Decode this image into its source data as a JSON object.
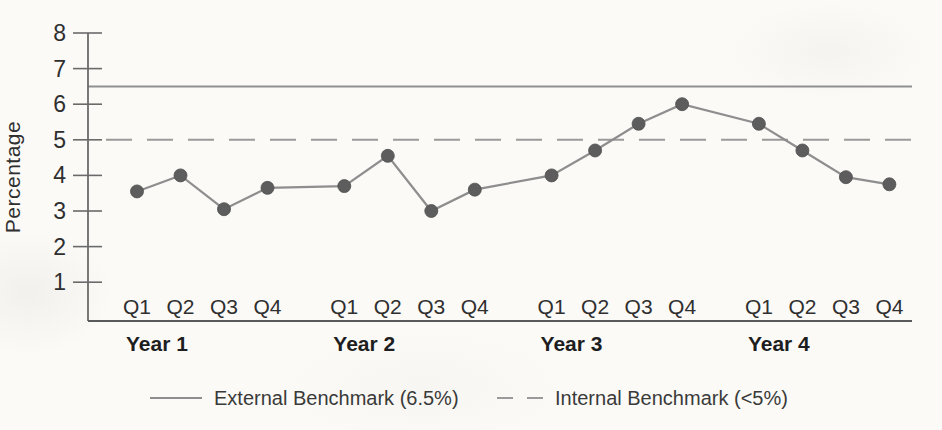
{
  "chart_data": {
    "type": "line",
    "title": "",
    "ylabel": "Percentage",
    "ylim": [
      0,
      8
    ],
    "yticks": [
      1,
      2,
      3,
      4,
      5,
      6,
      7,
      8
    ],
    "grid": false,
    "legend_position": "bottom",
    "groups": [
      {
        "label": "Year 1",
        "categories": [
          "Q1",
          "Q2",
          "Q3",
          "Q4"
        ]
      },
      {
        "label": "Year 2",
        "categories": [
          "Q1",
          "Q2",
          "Q3",
          "Q4"
        ]
      },
      {
        "label": "Year 3",
        "categories": [
          "Q1",
          "Q2",
          "Q3",
          "Q4"
        ]
      },
      {
        "label": "Year 4",
        "categories": [
          "Q1",
          "Q2",
          "Q3",
          "Q4"
        ]
      }
    ],
    "series": [
      {
        "values": [
          3.55,
          4.0,
          3.05,
          3.65,
          3.7,
          4.55,
          3.0,
          3.6,
          4.0,
          4.7,
          5.45,
          6.0,
          5.45,
          4.7,
          3.95,
          3.75
        ]
      }
    ],
    "benchmarks": [
      {
        "name": "External Benchmark (6.5%)",
        "value": 6.5,
        "style": "solid"
      },
      {
        "name": "Internal Benchmark (<5%)",
        "value": 5.0,
        "style": "dashed"
      }
    ],
    "colors": {
      "line": "#8e8e8e",
      "marker": "#5d5d5d",
      "benchmark_solid": "#8f8f8f",
      "benchmark_dashed": "#9a9a9a",
      "axis": "#5a5a5a",
      "tick_text": "#2f2f2f",
      "year_text": "#1e1e1e",
      "legend_text": "#3a3a3a"
    }
  }
}
